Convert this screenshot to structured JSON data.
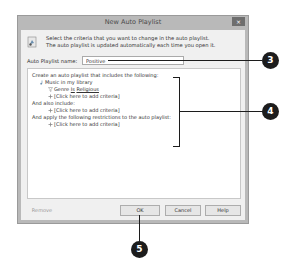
{
  "dialog": {
    "title": "New Auto Playlist",
    "close_label": "×",
    "info_line1": "Select the criteria that you want to change in the auto playlist.",
    "info_line2": "The auto playlist is updated automatically each time you open it.",
    "name_label": "Auto Playlist name:",
    "name_value": "Positive",
    "criteria": {
      "header": "Create an auto playlist that includes the following:",
      "source": "Music in my library",
      "genre_field": "Genre",
      "genre_op": "Is",
      "genre_value": "Religious",
      "add_criteria_1": "[Click here to add criteria]",
      "also_include": "And also include:",
      "add_criteria_2": "[Click here to add criteria]",
      "restrictions": "And apply the following restrictions to the auto playlist:",
      "add_criteria_3": "[Click here to add criteria]"
    },
    "buttons": {
      "remove": "Remove",
      "ok": "OK",
      "cancel": "Cancel",
      "help": "Help"
    }
  },
  "callouts": {
    "c3": "3",
    "c4": "4",
    "c5": "5"
  }
}
